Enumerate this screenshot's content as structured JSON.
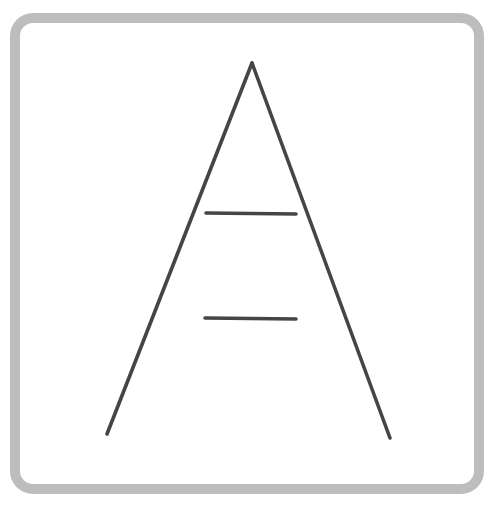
{
  "figure": {
    "name": "Ponzo illusion",
    "frame": {
      "x": 15,
      "y": 18,
      "width": 464,
      "height": 471,
      "radius": 18,
      "stroke": "#bdbdbd",
      "stroke_width": 10
    },
    "ink_color": "#454545",
    "converging_lines": [
      {
        "x1": 252,
        "y1": 63,
        "x2": 107,
        "y2": 434
      },
      {
        "x1": 252,
        "y1": 63,
        "x2": 390,
        "y2": 438
      }
    ],
    "horizontal_bars": [
      {
        "label": "upper-bar",
        "x1": 206,
        "y1": 213,
        "x2": 296,
        "y2": 214
      },
      {
        "label": "lower-bar",
        "x1": 205,
        "y1": 318,
        "x2": 296,
        "y2": 319
      }
    ]
  }
}
